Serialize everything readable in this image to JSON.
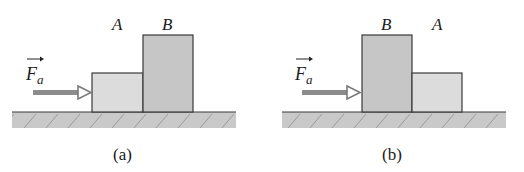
{
  "colors": {
    "block_light": "#dcdcdc",
    "block_dark": "#c6c6c6",
    "ground": "#c9c9c9",
    "ground_hatch": "#8a8a8a",
    "outline": "#3a3a3a",
    "arrow": "#8c8c8c"
  },
  "panels": [
    {
      "caption": "(a)",
      "force_label": "F",
      "force_subscript": "a",
      "blocks": [
        {
          "label": "A",
          "size": "short"
        },
        {
          "label": "B",
          "size": "tall"
        }
      ]
    },
    {
      "caption": "(b)",
      "force_label": "F",
      "force_subscript": "a",
      "blocks": [
        {
          "label": "B",
          "size": "tall"
        },
        {
          "label": "A",
          "size": "short"
        }
      ]
    }
  ]
}
